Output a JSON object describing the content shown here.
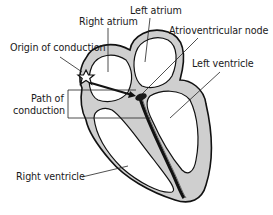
{
  "diagram": {
    "labels": {
      "left_atrium": "Left atrium",
      "right_atrium": "Right atrium",
      "atrioventricular_node": "Atrioventricular node",
      "origin_of_conduction": "Origin of conduction",
      "left_ventricle": "Left ventricle",
      "path_of_conduction_line1": "Path of",
      "path_of_conduction_line2": "conduction",
      "right_ventricle": "Right ventricle"
    },
    "colors": {
      "wall_fill": "#cfcfcf",
      "outline": "#111111",
      "background": "#ffffff",
      "leader_line": "#222222"
    }
  }
}
